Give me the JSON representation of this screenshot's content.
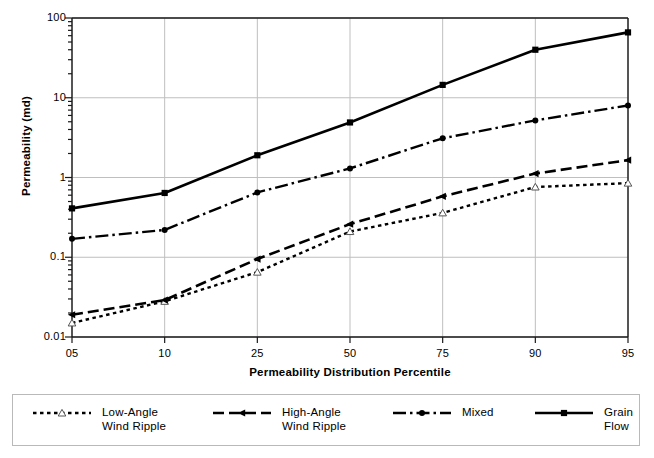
{
  "chart_data": {
    "type": "line",
    "title": "",
    "xlabel": "Permeability Distribution Percentile",
    "ylabel": "Permeability (md)",
    "categories": [
      "05",
      "10",
      "25",
      "50",
      "75",
      "90",
      "95"
    ],
    "yscale": "log",
    "ylim": [
      0.01,
      100
    ],
    "ytick_labels": [
      "0.01",
      "0.1",
      "1",
      "10",
      "100"
    ],
    "ytick_values": [
      0.01,
      0.1,
      1,
      10,
      100
    ],
    "grid": "major-xy",
    "legend_position": "bottom",
    "series": [
      {
        "name": "Low-Angle\nWind Ripple",
        "label": "Low-Angle Wind Ripple",
        "line_style": "dotted",
        "marker": "triangle-open",
        "color": "#000000",
        "values": [
          0.015,
          0.028,
          0.065,
          0.21,
          0.36,
          0.76,
          0.85
        ]
      },
      {
        "name": "High-Angle\nWind Ripple",
        "label": "High-Angle Wind Ripple",
        "line_style": "dashed",
        "marker": "triangle-left",
        "color": "#000000",
        "values": [
          0.019,
          0.029,
          0.095,
          0.26,
          0.58,
          1.12,
          1.65
        ]
      },
      {
        "name": "Mixed",
        "label": "Mixed",
        "line_style": "dashdot",
        "marker": "circle",
        "color": "#000000",
        "values": [
          0.17,
          0.22,
          0.65,
          1.3,
          3.1,
          5.2,
          8.0
        ]
      },
      {
        "name": "Grain Flow",
        "label": "Grain Flow",
        "line_style": "solid",
        "marker": "square",
        "color": "#000000",
        "values": [
          0.41,
          0.64,
          1.9,
          4.9,
          14.5,
          40.0,
          66.0
        ]
      }
    ]
  },
  "legend": {
    "items": [
      {
        "label": "Low-Angle\nWind Ripple",
        "style": "dotted",
        "marker": "triangle-open"
      },
      {
        "label": "High-Angle\nWind Ripple",
        "style": "dashed",
        "marker": "triangle-left"
      },
      {
        "label": "Mixed",
        "style": "dashdot",
        "marker": "circle"
      },
      {
        "label": "Grain Flow",
        "style": "solid",
        "marker": "square"
      }
    ]
  },
  "colors": {
    "axis": "#1a1a1a",
    "grid": "#bfbfbf",
    "line": "#000000",
    "legend_border": "#b9b9b9",
    "background": "#ffffff"
  }
}
